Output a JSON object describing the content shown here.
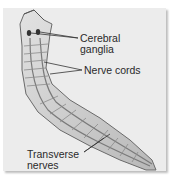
{
  "figure": {
    "labels": [
      {
        "id": "cerebral",
        "text_line1": "Cerebral",
        "text_line2": "ganglia"
      },
      {
        "id": "cords",
        "text_line1": "Nerve cords"
      },
      {
        "id": "transverse",
        "text_line1": "Transverse",
        "text_line2": "nerves"
      }
    ],
    "colors": {
      "panel": "#ececec",
      "body_fill": "#cfcfcf",
      "outline": "#6a6a6a",
      "text": "#2a2a2a"
    }
  }
}
